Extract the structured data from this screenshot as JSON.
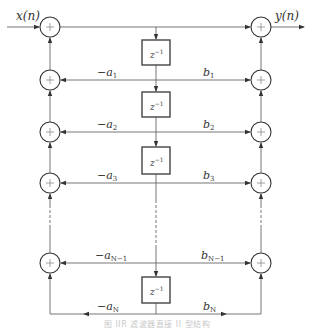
{
  "diagram": {
    "type": "iir-direct-form-ii-block-diagram",
    "input_label": "x(n)",
    "output_label": "y(n)",
    "delay_label": {
      "base": "z",
      "exp": "−1"
    },
    "adder_symbol": "+",
    "feedback_labels": [
      {
        "sign": "−",
        "coef": "a",
        "sub": "1"
      },
      {
        "sign": "−",
        "coef": "a",
        "sub": "2"
      },
      {
        "sign": "−",
        "coef": "a",
        "sub": "3"
      },
      {
        "sign": "−",
        "coef": "a",
        "sub": "N−1"
      },
      {
        "sign": "−",
        "coef": "a",
        "sub": "N"
      }
    ],
    "feedforward_labels": [
      {
        "coef": "b",
        "sub": "1"
      },
      {
        "coef": "b",
        "sub": "2"
      },
      {
        "coef": "b",
        "sub": "3"
      },
      {
        "coef": "b",
        "sub": "N−1"
      },
      {
        "coef": "b",
        "sub": "N"
      }
    ],
    "colors": {
      "line": "#555555",
      "box": "#444444",
      "text": "#333333"
    }
  },
  "caption": "图 IIR 滤波器直接 II 型结构"
}
